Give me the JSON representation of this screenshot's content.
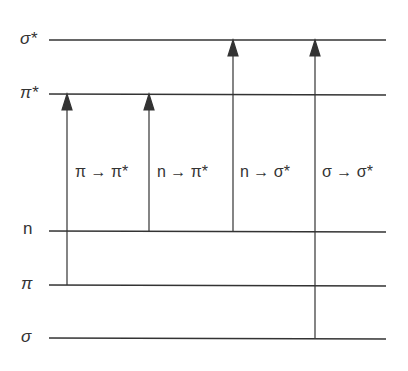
{
  "diagram": {
    "type": "energy-level-diagram",
    "levels": [
      {
        "id": "sigma_star",
        "label": "σ*",
        "y": 40
      },
      {
        "id": "pi_star",
        "label": "π*",
        "y": 94
      },
      {
        "id": "n",
        "label": "n",
        "y": 231
      },
      {
        "id": "pi",
        "label": "π",
        "y": 285
      },
      {
        "id": "sigma",
        "label": "σ",
        "y": 338
      }
    ],
    "transitions": [
      {
        "label": "π → π*",
        "from": "π",
        "to": "π*"
      },
      {
        "label": "n → π*",
        "from": "n",
        "to": "π*"
      },
      {
        "label": "n → σ*",
        "from": "n",
        "to": "σ*"
      },
      {
        "label": "σ → σ*",
        "from": "σ",
        "to": "σ*"
      }
    ],
    "line_color": "#333333"
  }
}
